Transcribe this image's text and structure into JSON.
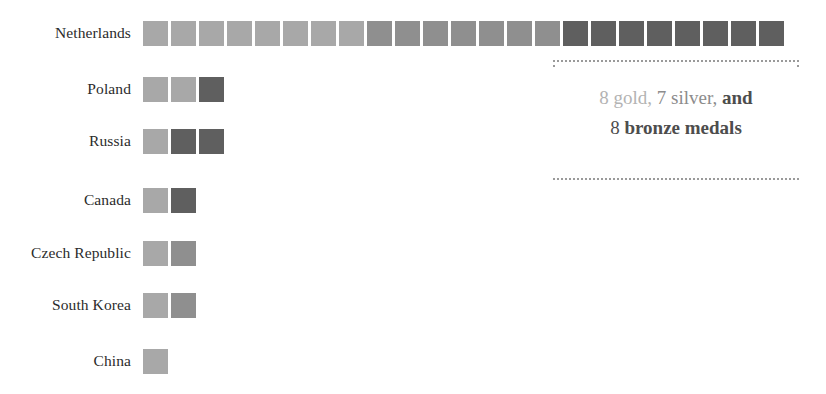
{
  "chart_data": {
    "type": "bar",
    "subtype": "unit-waffle-stacked",
    "title": "",
    "xlabel": "",
    "ylabel": "",
    "unit_label": "medal",
    "legend": [
      {
        "name": "gold",
        "color": "#a8a8a8"
      },
      {
        "name": "silver",
        "color": "#8f8f8f"
      },
      {
        "name": "bronze",
        "color": "#5f5f5f"
      }
    ],
    "categories": [
      "Netherlands",
      "Poland",
      "Russia",
      "Canada",
      "Czech Republic",
      "South Korea",
      "China"
    ],
    "series": [
      {
        "name": "gold",
        "values": [
          8,
          2,
          1,
          1,
          1,
          1,
          1
        ]
      },
      {
        "name": "silver",
        "values": [
          7,
          0,
          0,
          0,
          1,
          1,
          0
        ]
      },
      {
        "name": "bronze",
        "values": [
          8,
          1,
          2,
          1,
          0,
          0,
          0
        ]
      }
    ],
    "totals": [
      23,
      3,
      3,
      2,
      2,
      2,
      1
    ],
    "grid": false,
    "legend_position": "none"
  },
  "rows": [
    {
      "label": "Netherlands",
      "units": [
        "gold",
        "gold",
        "gold",
        "gold",
        "gold",
        "gold",
        "gold",
        "gold",
        "silver",
        "silver",
        "silver",
        "silver",
        "silver",
        "silver",
        "silver",
        "bronze",
        "bronze",
        "bronze",
        "bronze",
        "bronze",
        "bronze",
        "bronze",
        "bronze"
      ]
    },
    {
      "label": "Poland",
      "units": [
        "gold",
        "gold",
        "bronze"
      ]
    },
    {
      "label": "Russia",
      "units": [
        "gold",
        "bronze",
        "bronze"
      ]
    },
    {
      "label": "Canada",
      "units": [
        "gold",
        "bronze"
      ]
    },
    {
      "label": "Czech Republic",
      "units": [
        "gold",
        "silver"
      ]
    },
    {
      "label": "South Korea",
      "units": [
        "gold",
        "silver"
      ]
    },
    {
      "label": "China",
      "units": [
        "gold"
      ]
    }
  ],
  "annotation": {
    "line1_gold": "8 gold,",
    "line1_silver": "7 silver,",
    "line1_and": "and",
    "line2_count": "8",
    "line2_bronze": "bronze",
    "line2_suffix": "medals"
  },
  "colors": {
    "gold": "#a8a8a8",
    "silver": "#8f8f8f",
    "bronze": "#5f5f5f",
    "label_text": "#2b2b2b",
    "bracket": "#9a9a9a",
    "background": "#ffffff"
  }
}
